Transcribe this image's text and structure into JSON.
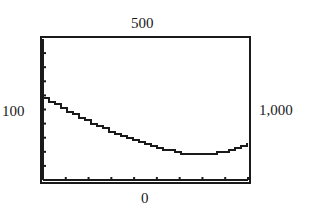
{
  "window": {
    "xmin_label": "100",
    "xmax_label": "1,000",
    "ymin_label": "0",
    "ymax_label": "500"
  },
  "chart_data": {
    "type": "line",
    "title": "",
    "xlabel": "",
    "ylabel": "",
    "xlim": [
      100,
      1000
    ],
    "ylim": [
      0,
      500
    ],
    "x_tick_interval": 100,
    "y_tick_interval": 50,
    "grid": false,
    "legend": null,
    "window_labels": {
      "left": "100",
      "right": "1,000",
      "top": "500",
      "bottom": "0"
    },
    "series": [
      {
        "name": "curve",
        "x": [
          100,
          200,
          300,
          400,
          500,
          600,
          700,
          800,
          900,
          1000
        ],
        "y": [
          290,
          245,
          205,
          170,
          140,
          115,
          95,
          90,
          100,
          130
        ]
      }
    ]
  }
}
